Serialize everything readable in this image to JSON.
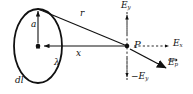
{
  "figure": {
    "background_color": "#ffffff",
    "stroke_color": "#111111",
    "width": 193,
    "height": 94
  },
  "labels": {
    "radius": "a",
    "distance_r": "r",
    "distance_x": "x",
    "point_p": "P",
    "charge_density": "λ",
    "length_element": "dl",
    "field_x": "E",
    "field_x_sub": "x",
    "field_y_pos": "E",
    "field_y_pos_sub": "y",
    "field_y_neg": "−E",
    "field_y_neg_sub": "y",
    "field_resultant": "E",
    "field_resultant_sub": "p"
  },
  "geometry": {
    "ring_center": [
      38,
      46
    ],
    "ring_top": [
      38,
      9
    ],
    "ring_rx": 24,
    "ring_ry": 37,
    "point_p": [
      127,
      46
    ],
    "axis_from": [
      38,
      46
    ],
    "axis_to": [
      127,
      46
    ],
    "r_from": [
      38,
      9
    ],
    "r_to": [
      127,
      46
    ]
  },
  "arrows": {
    "radius_arrow": "double-headed vertical, center to ring top",
    "x_axis_arrow": "horizontal from P toward ring center",
    "ey_up_arrow": "dashed vertical up from P",
    "ey_down_arrow": "dashed vertical down from P",
    "ex_arrow": "dashed horizontal right from P",
    "ep_arrow": "solid diagonal down-right from P"
  }
}
